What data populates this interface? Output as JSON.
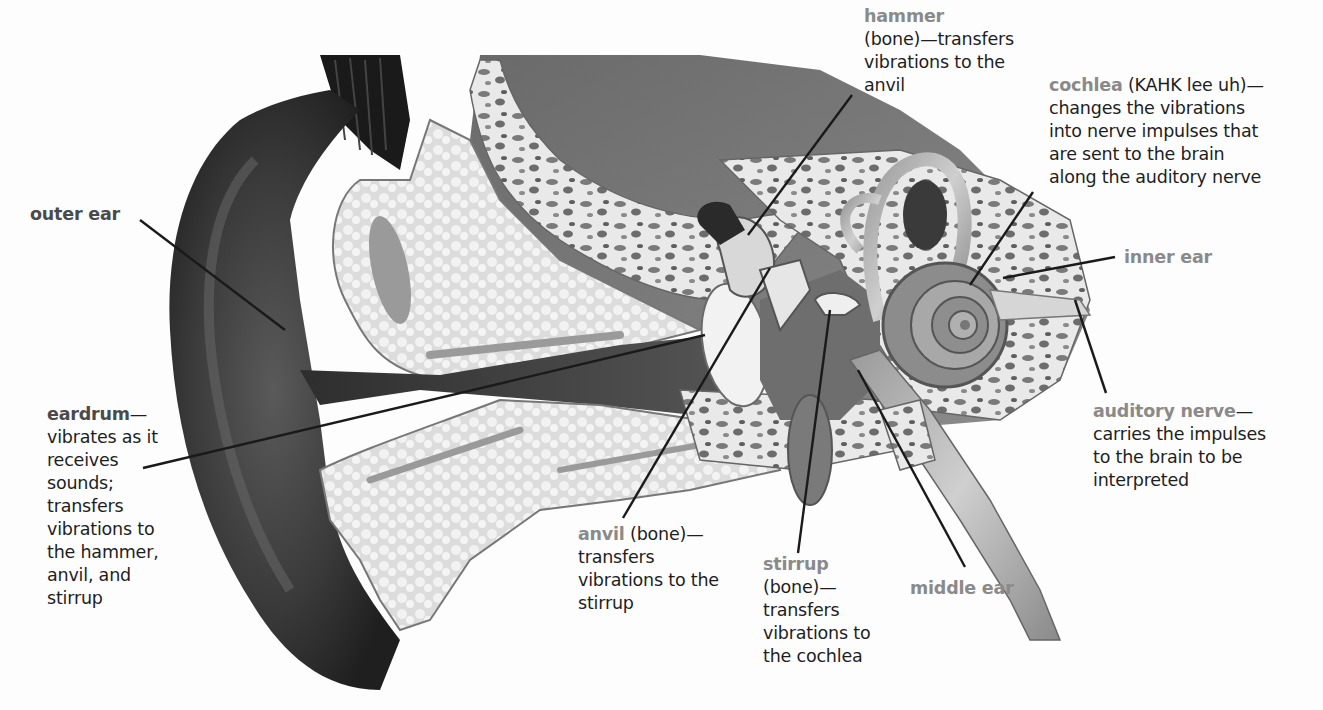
{
  "diagram": {
    "colors": {
      "term_highlight": "#8a8a8a",
      "term_dark": "#4a4a4a",
      "body_text": "#1e1e1e",
      "leader_line": "#1a1a1a"
    },
    "labels": {
      "hammer": {
        "term": "hammer",
        "lines": [
          "(bone)—transfers",
          "vibrations to the",
          "anvil"
        ]
      },
      "cochlea": {
        "term": "cochlea",
        "first_line_rest": " (KAHK lee uh)—",
        "lines": [
          "changes the vibrations",
          "into nerve impulses that",
          "are sent to the brain",
          "along the auditory nerve"
        ]
      },
      "outer_ear": {
        "term": "outer ear"
      },
      "inner_ear": {
        "term": "inner ear"
      },
      "eardrum": {
        "term": "eardrum",
        "term_suffix": "—",
        "lines": [
          "vibrates as it",
          "receives",
          "sounds;",
          "transfers",
          "vibrations to",
          "the hammer,",
          "anvil, and",
          "stirrup"
        ]
      },
      "auditory_nerve": {
        "term": "auditory nerve",
        "term_suffix": "—",
        "lines": [
          "carries the impulses",
          "to the brain to be",
          "interpreted"
        ]
      },
      "anvil": {
        "term": "anvil",
        "first_line_rest": " (bone)—",
        "lines": [
          "transfers",
          "vibrations to the",
          "stirrup"
        ]
      },
      "stirrup": {
        "term": "stirrup",
        "lines": [
          "(bone)—",
          "transfers",
          "vibrations to",
          "the cochlea"
        ]
      },
      "middle_ear": {
        "term": "middle ear"
      }
    }
  }
}
